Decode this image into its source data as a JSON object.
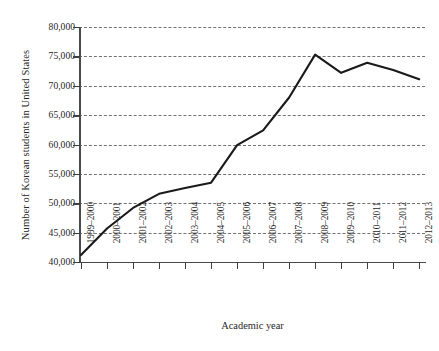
{
  "chart_data": {
    "type": "line",
    "title": "",
    "xlabel": "Academic year",
    "ylabel": "Number of Korean students in United States",
    "ylim": [
      40000,
      80000
    ],
    "yticks": [
      40000,
      45000,
      50000,
      55000,
      60000,
      65000,
      70000,
      75000,
      80000
    ],
    "ytick_labels": [
      "40,000",
      "45,000",
      "50,000",
      "55,000",
      "60,000",
      "65,000",
      "70,000",
      "75,000",
      "80,000"
    ],
    "grid": true,
    "grid_style": "dashed",
    "legend": "none",
    "line_color": "#1a1a1a",
    "categories": [
      "1999–2000",
      "2000–2001",
      "2001–2002",
      "2002–2003",
      "2003–2004",
      "2004–2005",
      "2005–2006",
      "2006–2007",
      "2007–2008",
      "2008–2009",
      "2009–2010",
      "2010–2011",
      "2011–2012",
      "2012–2013"
    ],
    "values": [
      41200,
      45700,
      49200,
      51600,
      52600,
      53500,
      59900,
      62400,
      68000,
      75300,
      72200,
      73900,
      72700,
      71100
    ]
  },
  "caption": {
    "sliver_text": ""
  }
}
